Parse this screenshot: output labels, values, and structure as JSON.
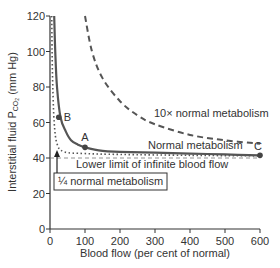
{
  "chart_data": {
    "type": "line",
    "title": "",
    "xlabel": "Blood flow (per cent of normal)",
    "ylabel": "Interstitial fluid PCO2 (mm Hg)",
    "ylabel_parts": {
      "main": "Interstitial fluid P",
      "sub": "CO",
      "sub2": "2",
      "unit": " (mm Hg)"
    },
    "xlim": [
      0,
      600
    ],
    "ylim": [
      0,
      120
    ],
    "x_ticks": [
      0,
      100,
      200,
      300,
      400,
      500,
      600
    ],
    "y_ticks": [
      0,
      20,
      40,
      60,
      80,
      100,
      120
    ],
    "grid": false,
    "legend": "none",
    "series": [
      {
        "name": "Normal metabolism",
        "style": "solid",
        "color": "#555555",
        "x": [
          12,
          15,
          20,
          30,
          45,
          60,
          80,
          100,
          150,
          200,
          300,
          400,
          500,
          600
        ],
        "y": [
          120,
          100,
          80,
          63,
          55,
          50,
          47.5,
          46,
          44,
          43.5,
          43,
          42.5,
          42,
          41.5
        ]
      },
      {
        "name": "10× normal metabolism",
        "style": "dashed",
        "color": "#555555",
        "x": [
          100,
          120,
          150,
          200,
          250,
          300,
          400,
          500,
          600
        ],
        "y": [
          120,
          100,
          85,
          72,
          64,
          59,
          53,
          50,
          48
        ]
      },
      {
        "name": "¼ normal metabolism",
        "style": "dotted",
        "color": "#555555",
        "x": [
          5,
          6,
          8,
          12,
          20,
          40,
          100,
          200,
          400,
          600
        ],
        "y": [
          120,
          100,
          80,
          60,
          48,
          43.5,
          42.5,
          42,
          41.5,
          41.2
        ]
      },
      {
        "name": "Lower limit of infinite blood flow",
        "style": "thin-dashed",
        "color": "#777777",
        "x": [
          0,
          600
        ],
        "y": [
          40,
          40
        ]
      }
    ],
    "points": [
      {
        "label": "A",
        "x": 100,
        "y": 46
      },
      {
        "label": "B",
        "x": 25,
        "y": 63
      },
      {
        "label": "C",
        "x": 600,
        "y": 41.5
      }
    ],
    "annotations": [
      {
        "text": "10× normal metabolism",
        "x": 265,
        "y": 59
      },
      {
        "text": "Normal metabolism",
        "x": 275,
        "y": 47
      },
      {
        "text": "Lower limit of infinite blood flow",
        "x": 125,
        "y": 36
      },
      {
        "text": "¼ normal metabolism",
        "boxed": true,
        "x": 15,
        "y": 30
      }
    ],
    "arrow": {
      "from": {
        "x": 20,
        "y": 30
      },
      "to": {
        "x": 20,
        "y": 42
      }
    }
  }
}
